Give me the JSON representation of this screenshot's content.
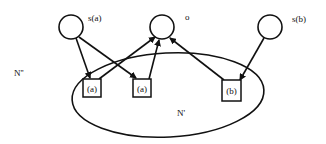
{
  "diagram": {
    "nodes": [
      {
        "id": "s_a",
        "shape": "circle",
        "label": "s(a)",
        "cx": 71,
        "cy": 27,
        "r": 12,
        "label_x": 90,
        "label_y": 20
      },
      {
        "id": "o",
        "shape": "circle",
        "label": "o",
        "cx": 162,
        "cy": 27,
        "r": 12,
        "label_x": 185,
        "label_y": 20
      },
      {
        "id": "s_b",
        "shape": "circle",
        "label": "s(b)",
        "cx": 270,
        "cy": 27,
        "r": 12,
        "label_x": 290,
        "label_y": 20
      },
      {
        "id": "box_a1",
        "shape": "square",
        "label": "(a)",
        "x": 83,
        "y": 79,
        "w": 18,
        "h": 18
      },
      {
        "id": "box_a2",
        "shape": "square",
        "label": "(a)",
        "x": 133,
        "y": 79,
        "w": 18,
        "h": 18
      },
      {
        "id": "box_b",
        "shape": "square",
        "label": "(b)",
        "x": 222,
        "y": 80,
        "w": 19,
        "h": 21
      }
    ],
    "edges": [
      {
        "from": "s_a",
        "to": "box_a1"
      },
      {
        "from": "s_a",
        "to": "box_a2"
      },
      {
        "from": "box_a1",
        "to": "o"
      },
      {
        "from": "box_a2",
        "to": "o"
      },
      {
        "from": "box_b",
        "to": "o"
      },
      {
        "from": "s_b",
        "to": "box_b"
      }
    ],
    "regions": [
      {
        "id": "N_prime",
        "label": "N'",
        "label_x": 178,
        "label_y": 117
      },
      {
        "id": "N_double_prime",
        "label": "N''",
        "label_x": 14,
        "label_y": 75
      }
    ]
  }
}
